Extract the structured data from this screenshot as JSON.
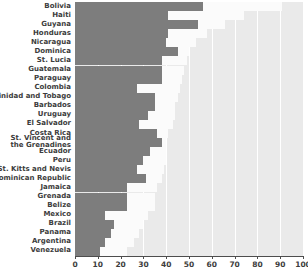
{
  "chart_data": {
    "type": "bar",
    "orientation": "horizontal",
    "title": "",
    "subtitle": "",
    "xlabel": "",
    "ylabel": "",
    "xlim": [
      0,
      100
    ],
    "xticks": [
      0,
      10,
      20,
      30,
      40,
      50,
      60,
      70,
      80,
      90,
      100
    ],
    "xticklabels": [
      "0",
      "10",
      "20",
      "30",
      "40",
      "50",
      "60",
      "70",
      "80",
      "90",
      "100"
    ],
    "grid": "vertical-white-gridlines",
    "legend": "none",
    "panel_color": "#eaeaea",
    "categories": [
      "Bolivia",
      "Haiti",
      "Guyana",
      "Honduras",
      "Nicaragua",
      "Dominica",
      "St. Lucia",
      "Guatemala",
      "Paraguay",
      "Colombia",
      "Trinidad and Tobago",
      "Barbados",
      "Uruguay",
      "El Salvador",
      "Costa Rica",
      "St. Vincent and the Grenadines",
      "Ecuador",
      "Peru",
      "St. Kitts and Nevis",
      "Dominican Republic",
      "Jamaica",
      "Grenada",
      "Belize",
      "Mexico",
      "Brazil",
      "Panama",
      "Argentina",
      "Venezuela"
    ],
    "series": [
      {
        "name": "foreground",
        "color": "#7d7d7d",
        "values": [
          56,
          41,
          54,
          41,
          40,
          45,
          38,
          38,
          38,
          27,
          35,
          35,
          32,
          28,
          36,
          38,
          33,
          30,
          27,
          31,
          23,
          23,
          23,
          13,
          17,
          16,
          13,
          11
        ]
      },
      {
        "name": "background",
        "color": "#fbfbfb",
        "values": [
          91,
          74,
          66,
          58,
          53,
          50,
          49,
          48,
          47,
          46,
          45,
          44,
          44,
          43,
          41,
          40,
          40,
          40,
          39,
          38,
          36,
          35,
          35,
          32,
          30,
          28,
          26,
          23
        ]
      }
    ]
  }
}
